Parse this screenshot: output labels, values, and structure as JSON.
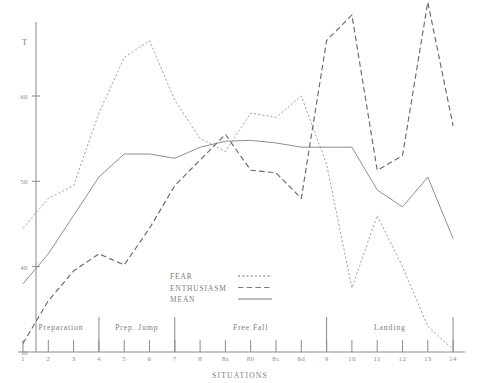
{
  "chart_data": {
    "type": "line",
    "title": "",
    "xlabel": "SITUATIONS",
    "ylabel": "T",
    "ylim": [
      30,
      70
    ],
    "yticks": [
      30,
      40,
      50,
      60
    ],
    "ytick_labels": [
      "30",
      "40",
      "50",
      "60"
    ],
    "y_axis_top_label": "T",
    "grid": false,
    "legend_position": "center",
    "categories": [
      "1",
      "2",
      "3",
      "4",
      "5",
      "6",
      "7",
      "8",
      "8a",
      "8b",
      "8c",
      "8d",
      "9",
      "10",
      "11",
      "12",
      "13",
      "14"
    ],
    "series": [
      {
        "name": "FEAR",
        "style": "dotted",
        "values": [
          44.5,
          48.0,
          49.5,
          58.0,
          64.5,
          66.5,
          59.5,
          55.0,
          53.5,
          58.0,
          57.5,
          60.0,
          52.0,
          37.5,
          46.0,
          40.0,
          33.0,
          30.3
        ]
      },
      {
        "name": "ENTHUSIASM",
        "style": "dashed",
        "values": [
          31.0,
          36.0,
          39.5,
          41.5,
          40.2,
          44.5,
          49.5,
          52.5,
          55.5,
          51.3,
          51.0,
          48.0,
          66.5,
          69.5,
          51.3,
          53.0,
          71.0,
          56.5
        ]
      },
      {
        "name": "MEAN",
        "style": "solid",
        "values": [
          38.0,
          41.5,
          46.0,
          50.5,
          53.2,
          53.2,
          52.7,
          54.0,
          54.7,
          54.8,
          54.5,
          54.0,
          54.0,
          54.0,
          49.0,
          47.0,
          50.5,
          43.3
        ]
      }
    ],
    "phases": [
      {
        "label": "Preparation",
        "start": "1",
        "end": "4"
      },
      {
        "label": "Prep. Jump",
        "start": "4",
        "end": "7"
      },
      {
        "label": "Free Fall",
        "start": "7",
        "end": "9"
      },
      {
        "label": "Landing",
        "start": "9",
        "end": "14"
      }
    ],
    "phase_divider_categories": [
      "4",
      "7",
      "9",
      "14"
    ],
    "colors": {
      "fear": "#9a9a9a",
      "enthusiasm": "#6a6a6a",
      "mean": "#888888",
      "axis": "#8a8a8a",
      "text": "#7d7d7d",
      "background": "#ffffff"
    }
  },
  "legend": {
    "entries": [
      {
        "label": "FEAR",
        "style": "dotted"
      },
      {
        "label": "ENTHUSIASM",
        "style": "dashed"
      },
      {
        "label": "MEAN",
        "style": "solid"
      }
    ]
  }
}
